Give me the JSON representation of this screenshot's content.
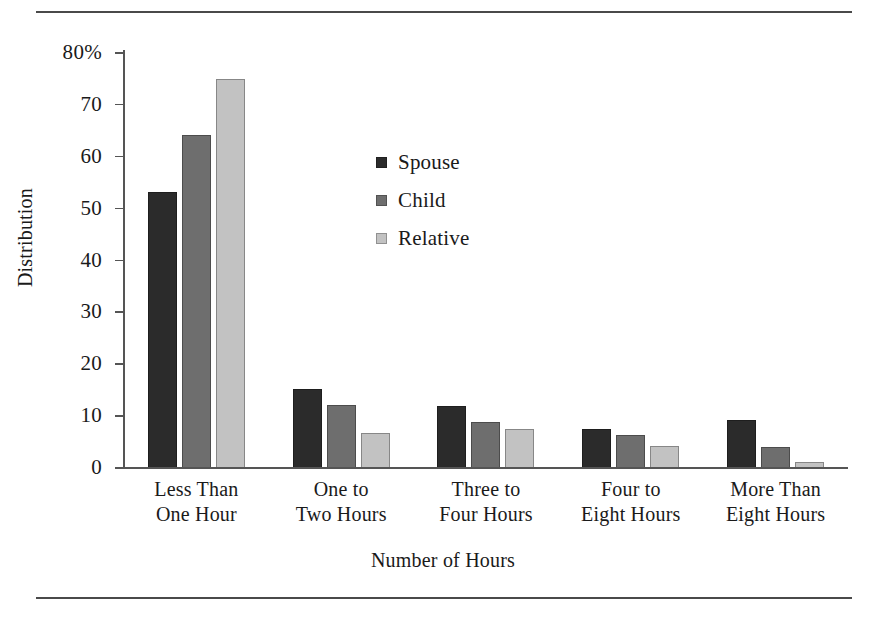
{
  "chart_data": {
    "type": "bar",
    "title": "",
    "xlabel": "Number of Hours",
    "ylabel": "Distribution",
    "categories": [
      "Less Than\nOne Hour",
      "One to\nTwo Hours",
      "Three to\nFour Hours",
      "Four to\nEight Hours",
      "More Than\nEight Hours"
    ],
    "series": [
      {
        "name": "Spouse",
        "color": "#2b2b2b",
        "values": [
          53,
          15,
          11.7,
          7.3,
          9.1
        ]
      },
      {
        "name": "Child",
        "color": "#6e6e6e",
        "values": [
          64,
          11.9,
          8.7,
          6.1,
          3.8
        ]
      },
      {
        "name": "Relative",
        "color": "#c2c2c2",
        "values": [
          74.8,
          6.6,
          7.4,
          4.0,
          0.9
        ]
      }
    ],
    "ylim": [
      0,
      80
    ],
    "yticks": [
      0,
      10,
      20,
      30,
      40,
      50,
      60,
      70,
      80
    ],
    "ytick_labels": [
      "0",
      "10",
      "20",
      "30",
      "40",
      "50",
      "60",
      "70",
      "80%"
    ],
    "grid": false,
    "legend_position": "inside-upper-right"
  },
  "legend": {
    "items": [
      {
        "label": "Spouse",
        "color": "#2b2b2b"
      },
      {
        "label": "Child",
        "color": "#6e6e6e"
      },
      {
        "label": "Relative",
        "color": "#c2c2c2"
      }
    ]
  }
}
